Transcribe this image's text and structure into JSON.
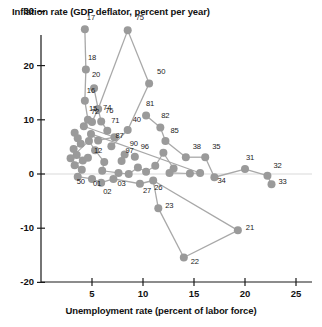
{
  "chart_data": {
    "type": "scatter",
    "title": "Inflation rate (GDP deflator, percent per year)",
    "xlabel": "Unemployment rate (percent of labor force)",
    "ylabel": "Inflation rate (GDP deflator, percent per year)",
    "xlim": [
      0,
      26.5
    ],
    "ylim": [
      -20,
      31
    ],
    "xticks": [
      5,
      10,
      15,
      20,
      25
    ],
    "yticks": [
      30,
      20,
      10,
      0,
      -10,
      -20
    ],
    "grid": false,
    "legend": null,
    "connected": true,
    "marker_color": "#9a9a9a",
    "line_color": "#a8a8a8",
    "zero_line": true,
    "point_label_key": "two-digit year",
    "points": [
      {
        "label": "17",
        "x": 4.3,
        "y": 26.7,
        "lx": -1,
        "ly": -12
      },
      {
        "label": "18",
        "x": 4.4,
        "y": 19.3,
        "lx": -1,
        "ly": -12
      },
      {
        "label": "20",
        "x": 5.2,
        "y": 15.8,
        "lx": -5,
        "ly": -14
      },
      {
        "label": "16",
        "x": 4.3,
        "y": 13.5,
        "lx": -1,
        "ly": -11
      },
      {
        "label": "15",
        "x": 4.6,
        "y": 10.0,
        "lx": -2,
        "ly": -12
      },
      {
        "label": "75",
        "x": 8.5,
        "y": 26.5,
        "lx": 5,
        "ly": -13
      },
      {
        "label": "50",
        "x": 10.6,
        "y": 16.7,
        "lx": 5,
        "ly": -12
      },
      {
        "label": "74",
        "x": 5.6,
        "y": 12.0,
        "lx": 2,
        "ly": -2
      },
      {
        "label": "72",
        "x": 5.0,
        "y": 9.6,
        "lx": -4,
        "ly": -11
      },
      {
        "label": "76",
        "x": 5.9,
        "y": 9.7,
        "lx": 1,
        "ly": -11
      },
      {
        "label": "71",
        "x": 6.5,
        "y": 8.0,
        "lx": 1,
        "ly": -11
      },
      {
        "label": "40",
        "x": 8.5,
        "y": 8.1,
        "lx": 2,
        "ly": -11
      },
      {
        "label": "81",
        "x": 10.3,
        "y": 10.8,
        "lx": -3,
        "ly": -12
      },
      {
        "label": "82",
        "x": 11.7,
        "y": 8.6,
        "lx": -2,
        "ly": -12
      },
      {
        "label": "85",
        "x": 12.2,
        "y": 6.1,
        "lx": 2,
        "ly": -11
      },
      {
        "label": "87",
        "x": 6.9,
        "y": 5.1,
        "lx": 1,
        "ly": -11
      },
      {
        "label": "90",
        "x": 8.2,
        "y": 3.6,
        "lx": 2,
        "ly": -11
      },
      {
        "label": "96",
        "x": 9.2,
        "y": 3.2,
        "lx": 3,
        "ly": -11
      },
      {
        "label": "97",
        "x": 7.9,
        "y": 2.4,
        "lx": 1,
        "ly": -11
      },
      {
        "label": "12",
        "x": 4.6,
        "y": 3.0,
        "lx": 3,
        "ly": -8
      },
      {
        "label": "38",
        "x": 14.2,
        "y": 3.1,
        "lx": 4,
        "ly": -11
      },
      {
        "label": "35",
        "x": 16.1,
        "y": 3.1,
        "lx": 4,
        "ly": -11
      },
      {
        "label": "31",
        "x": 20.0,
        "y": 0.9,
        "lx": -2,
        "ly": -12
      },
      {
        "label": "32",
        "x": 22.2,
        "y": -0.3,
        "lx": 3,
        "ly": -11
      },
      {
        "label": "33",
        "x": 22.6,
        "y": -1.9,
        "lx": 4,
        "ly": -3
      },
      {
        "label": "34",
        "x": 17.0,
        "y": -0.6,
        "lx": 0,
        "ly": 3
      },
      {
        "label": "50",
        "x": 3.6,
        "y": -0.5,
        "lx": -4,
        "ly": 4
      },
      {
        "label": "01",
        "x": 5.0,
        "y": -0.9,
        "lx": -2,
        "ly": 4
      },
      {
        "label": "02",
        "x": 5.9,
        "y": -1.6,
        "lx": -1,
        "ly": 8
      },
      {
        "label": "03",
        "x": 7.1,
        "y": -0.9,
        "lx": 1,
        "ly": 4
      },
      {
        "label": "27",
        "x": 9.7,
        "y": -1.8,
        "lx": 0,
        "ly": 6
      },
      {
        "label": "26",
        "x": 11.0,
        "y": -1.2,
        "lx": -2,
        "ly": 6
      },
      {
        "label": "23",
        "x": 11.5,
        "y": -6.3,
        "lx": 4,
        "ly": -3
      },
      {
        "label": "22",
        "x": 14.0,
        "y": -15.4,
        "lx": 4,
        "ly": 4
      },
      {
        "label": "21",
        "x": 19.3,
        "y": -10.4,
        "lx": 5,
        "ly": -3
      }
    ],
    "unlabeled_points": [
      {
        "x": 3.3,
        "y": 7.6
      },
      {
        "x": 3.6,
        "y": 6.6
      },
      {
        "x": 3.9,
        "y": 5.6
      },
      {
        "x": 3.2,
        "y": 4.6
      },
      {
        "x": 3.5,
        "y": 3.5
      },
      {
        "x": 4.1,
        "y": 2.5
      },
      {
        "x": 3.3,
        "y": 1.6
      },
      {
        "x": 4.0,
        "y": 0.8
      },
      {
        "x": 2.9,
        "y": 2.9
      },
      {
        "x": 4.7,
        "y": 6.1
      },
      {
        "x": 5.3,
        "y": 4.4
      },
      {
        "x": 6.2,
        "y": 2.2
      },
      {
        "x": 6.0,
        "y": 0.6
      },
      {
        "x": 7.6,
        "y": 0.2
      },
      {
        "x": 8.6,
        "y": 0.0
      },
      {
        "x": 9.5,
        "y": 1.2
      },
      {
        "x": 10.3,
        "y": 0.4
      },
      {
        "x": 11.2,
        "y": 1.5
      },
      {
        "x": 12.0,
        "y": 3.9
      },
      {
        "x": 13.0,
        "y": 1.0
      },
      {
        "x": 12.6,
        "y": 0.2
      },
      {
        "x": 14.6,
        "y": 0.1
      },
      {
        "x": 15.6,
        "y": 0.2
      },
      {
        "x": 4.9,
        "y": 7.4
      },
      {
        "x": 5.6,
        "y": 6.2
      },
      {
        "x": 7.2,
        "y": 6.8
      },
      {
        "x": 4.2,
        "y": 8.8
      }
    ],
    "segments": [
      [
        "17",
        "18"
      ],
      [
        "18",
        "16"
      ],
      [
        "16",
        "15"
      ],
      [
        "20",
        "74"
      ],
      [
        "75",
        "74"
      ],
      [
        "75",
        "50"
      ],
      [
        "74",
        "72"
      ],
      [
        "74",
        "76"
      ],
      [
        "76",
        "71"
      ],
      [
        "50",
        "40"
      ],
      [
        "40",
        "87"
      ],
      [
        "81",
        "82"
      ],
      [
        "82",
        "85"
      ],
      [
        "85",
        "38"
      ],
      [
        "38",
        "35"
      ],
      [
        "35",
        "34"
      ],
      [
        "34",
        "31"
      ],
      [
        "31",
        "32"
      ],
      [
        "32",
        "33"
      ],
      [
        "50b",
        "01"
      ],
      [
        "01",
        "02"
      ],
      [
        "02",
        "03"
      ],
      [
        "03",
        "27"
      ],
      [
        "27",
        "26"
      ],
      [
        "26",
        "23"
      ],
      [
        "23",
        "22"
      ],
      [
        "22",
        "21"
      ],
      [
        "21",
        "26"
      ]
    ]
  }
}
